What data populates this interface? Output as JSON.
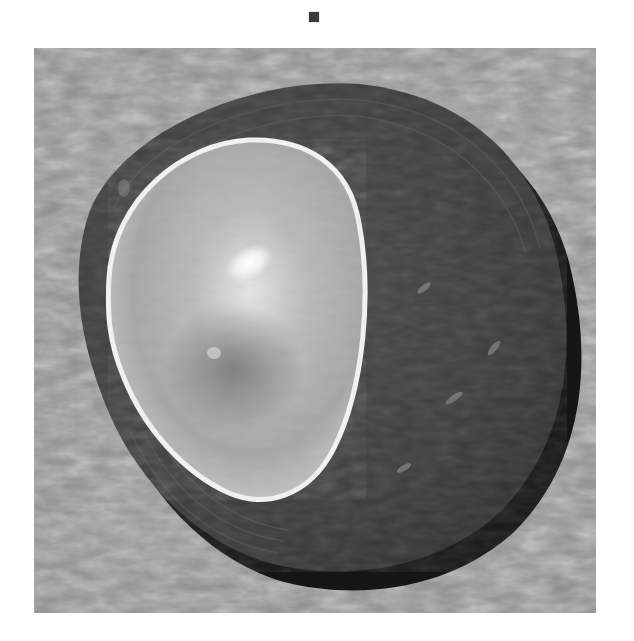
{
  "image": {
    "subject": "shell",
    "description": "Grayscale photograph of a shell with a bright pale inner valve on a dark outer shell, resting on textured gray background",
    "colors": {
      "background": "#ffffff",
      "substrate": "#8a8a8a",
      "outer_shell": "#3c3c3c",
      "shell_rim_shadow": "#111111",
      "inner_valve": "#c9c9c9",
      "inner_valve_edge": "#f2f2f2",
      "highlight": "#ffffff"
    }
  },
  "marker": {
    "shape": "square",
    "color": "#3a3a3a"
  }
}
